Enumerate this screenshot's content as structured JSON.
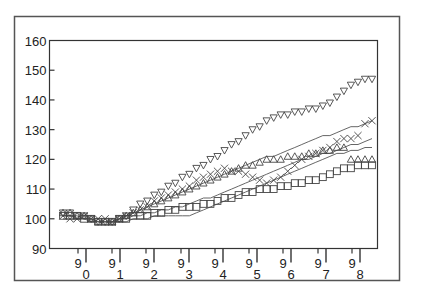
{
  "chart_data": {
    "type": "scatter",
    "title": "",
    "xlabel": "",
    "ylabel": "",
    "ylim": [
      90,
      160
    ],
    "yticks": [
      90,
      100,
      110,
      120,
      130,
      140,
      150,
      160
    ],
    "xticks_major": [
      "0",
      "1",
      "2",
      "3",
      "4",
      "5",
      "6",
      "7",
      "8"
    ],
    "xticks_minor": [
      "9",
      "9",
      "9",
      "9",
      "9",
      "9",
      "9",
      "9",
      "9"
    ],
    "grid": false,
    "legend": null,
    "x_index_range": [
      0,
      44
    ],
    "series": [
      {
        "name": "triangle-down",
        "marker": "triangle-down",
        "values": [
          102,
          102,
          101,
          101,
          100,
          99,
          99,
          99,
          100,
          101,
          103,
          105,
          106,
          108,
          109,
          111,
          112,
          114,
          115,
          117,
          118,
          120,
          121,
          123,
          125,
          126,
          128,
          130,
          131,
          133,
          134,
          135,
          135,
          136,
          136,
          137,
          137,
          138,
          139,
          141,
          143,
          145,
          146,
          147,
          147
        ]
      },
      {
        "name": "cross",
        "marker": "x",
        "values": [
          101,
          100,
          100,
          101,
          100,
          100,
          100,
          99,
          100,
          101,
          102,
          103,
          104,
          106,
          107,
          108,
          109,
          110,
          111,
          113,
          114,
          115,
          116,
          117,
          116,
          116,
          115,
          114,
          113,
          112,
          113,
          114,
          116,
          118,
          120,
          121,
          122,
          123,
          124,
          126,
          127,
          127,
          128,
          132,
          133
        ]
      },
      {
        "name": "triangle-up",
        "marker": "triangle-up",
        "values": [
          102,
          102,
          101,
          101,
          100,
          99,
          99,
          99,
          100,
          101,
          102,
          103,
          104,
          105,
          106,
          107,
          108,
          109,
          110,
          111,
          112,
          113,
          114,
          115,
          116,
          117,
          118,
          118,
          119,
          120,
          120,
          120,
          121,
          121,
          121,
          122,
          122,
          123,
          123,
          124,
          124,
          120,
          120,
          120,
          120
        ]
      },
      {
        "name": "square",
        "marker": "square",
        "values": [
          101,
          101,
          101,
          100,
          100,
          99,
          99,
          99,
          100,
          100,
          101,
          101,
          101,
          102,
          102,
          103,
          103,
          104,
          104,
          104,
          105,
          105,
          106,
          107,
          107,
          108,
          109,
          109,
          110,
          110,
          110,
          111,
          111,
          112,
          112,
          113,
          113,
          114,
          115,
          116,
          117,
          117,
          118,
          118,
          118
        ]
      },
      {
        "name": "line-upper",
        "marker": "none",
        "values": [
          101,
          101,
          101,
          100,
          100,
          99,
          99,
          99,
          100,
          101,
          102,
          103,
          104,
          105,
          106,
          107,
          108,
          109,
          110,
          111,
          112,
          113,
          114,
          115,
          116,
          117,
          118,
          119,
          120,
          121,
          121,
          122,
          123,
          124,
          125,
          126,
          127,
          128,
          128,
          129,
          130,
          131,
          131,
          132,
          133
        ]
      },
      {
        "name": "line-middle",
        "marker": "none",
        "values": [
          101,
          101,
          100,
          100,
          100,
          99,
          99,
          99,
          100,
          100,
          101,
          101,
          102,
          102,
          103,
          103,
          104,
          104,
          105,
          106,
          107,
          107,
          108,
          109,
          110,
          111,
          112,
          113,
          114,
          115,
          116,
          117,
          118,
          119,
          120,
          120,
          121,
          122,
          122,
          123,
          124,
          125,
          125,
          126,
          127
        ]
      },
      {
        "name": "line-lower",
        "marker": "none",
        "values": [
          100,
          100,
          100,
          100,
          99,
          99,
          99,
          99,
          99,
          99,
          100,
          100,
          100,
          101,
          101,
          101,
          101,
          101,
          101,
          102,
          103,
          104,
          105,
          106,
          107,
          108,
          109,
          110,
          111,
          112,
          113,
          114,
          115,
          116,
          117,
          118,
          119,
          120,
          121,
          122,
          122,
          123,
          123,
          124,
          124
        ]
      }
    ]
  }
}
